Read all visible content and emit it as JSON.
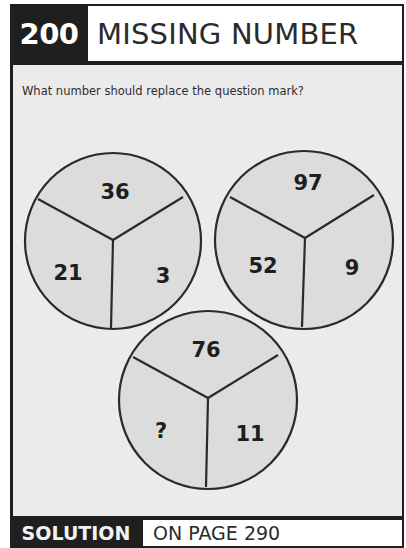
{
  "header": {
    "puzzle_number": "200",
    "title": "MISSING NUMBER"
  },
  "question": "What number should replace the question mark?",
  "circles": [
    {
      "top": "36",
      "left": "21",
      "right": "3"
    },
    {
      "top": "97",
      "left": "52",
      "right": "9"
    },
    {
      "top": "76",
      "left": "?",
      "right": "11"
    }
  ],
  "footer": {
    "label": "SOLUTION",
    "page_ref": "ON PAGE 290"
  },
  "colors": {
    "frame": "#1f1f1f",
    "background": "#ebebeb",
    "circle_fill": "#dcdcdc",
    "line": "#2a2a2a"
  }
}
